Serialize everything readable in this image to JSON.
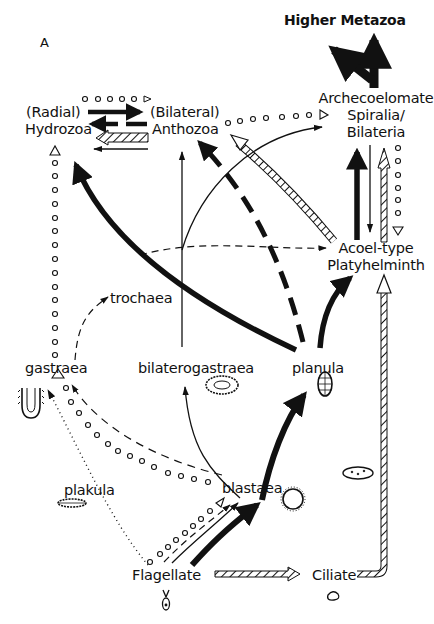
{
  "panel_label": "A",
  "nodes": {
    "higher_metazoa": "Higher Metazoa",
    "radial": "(Radial)",
    "hydrozoa": "Hydrozoa",
    "bilateral": "(Bilateral)",
    "anthozoa": "Anthozoa",
    "archecoelomate_1": "Archecoelomate",
    "archecoelomate_2": "Spiralia/",
    "archecoelomate_3": "Bilateria",
    "acoel_1": "Acoel-type",
    "acoel_2": "Platyhelminth",
    "trochaea": "trochaea",
    "gastraea": "gastraea",
    "bilaterogastraea": "bilaterogastraea",
    "planula": "planula",
    "plakula": "plakula",
    "blastaea": "blastaea",
    "flagellate": "Flagellate",
    "ciliate": "Ciliate"
  },
  "arrow_styles": {
    "thick_solid": "strongly supported pathway",
    "thick_dashed": "dashed pathway",
    "thin_solid": "thin pathway",
    "thin_dashed": "thin dashed pathway",
    "dotted": "dotted pathway",
    "circles": "open-circle chain pathway",
    "hatched": "hatched double-line pathway"
  },
  "colors": {
    "ink": "#111111",
    "background": "#ffffff"
  }
}
